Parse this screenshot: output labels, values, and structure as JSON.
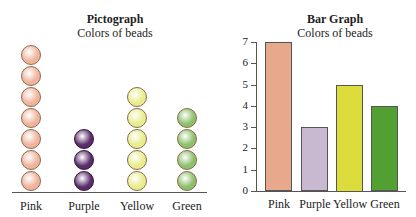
{
  "chart_data": [
    {
      "type": "pictograph",
      "title": "Pictograph",
      "subtitle": "Colors of beads",
      "categories": [
        "Pink",
        "Purple",
        "Yellow",
        "Green"
      ],
      "values": [
        7,
        3,
        5,
        4
      ],
      "colors": [
        "#f0b49c",
        "#5a2e6a",
        "#e8ec8c",
        "#8cc06a"
      ],
      "xlabel": "",
      "ylabel": ""
    },
    {
      "type": "bar",
      "title": "Bar Graph",
      "subtitle": "Colors of beads",
      "categories": [
        "Pink",
        "Purple",
        "Yellow",
        "Green"
      ],
      "values": [
        7,
        3,
        5,
        4
      ],
      "colors": [
        "#e8a88c",
        "#c8b8d0",
        "#dcdc3c",
        "#52a032"
      ],
      "yticks": [
        0,
        1,
        2,
        3,
        4,
        5,
        6,
        7
      ],
      "ylim": [
        0,
        7
      ],
      "xlabel": "",
      "ylabel": "",
      "grid": false
    }
  ],
  "pictograph": {
    "title": "Pictograph",
    "subtitle": "Colors of beads",
    "labels": [
      "Pink",
      "Purple",
      "Yellow",
      "Green"
    ]
  },
  "bargraph": {
    "title": "Bar Graph",
    "subtitle": "Colors of beads",
    "labels": [
      "Pink",
      "Purple",
      "Yellow",
      "Green"
    ],
    "ticks": [
      "0",
      "1",
      "2",
      "3",
      "4",
      "5",
      "6",
      "7"
    ]
  }
}
